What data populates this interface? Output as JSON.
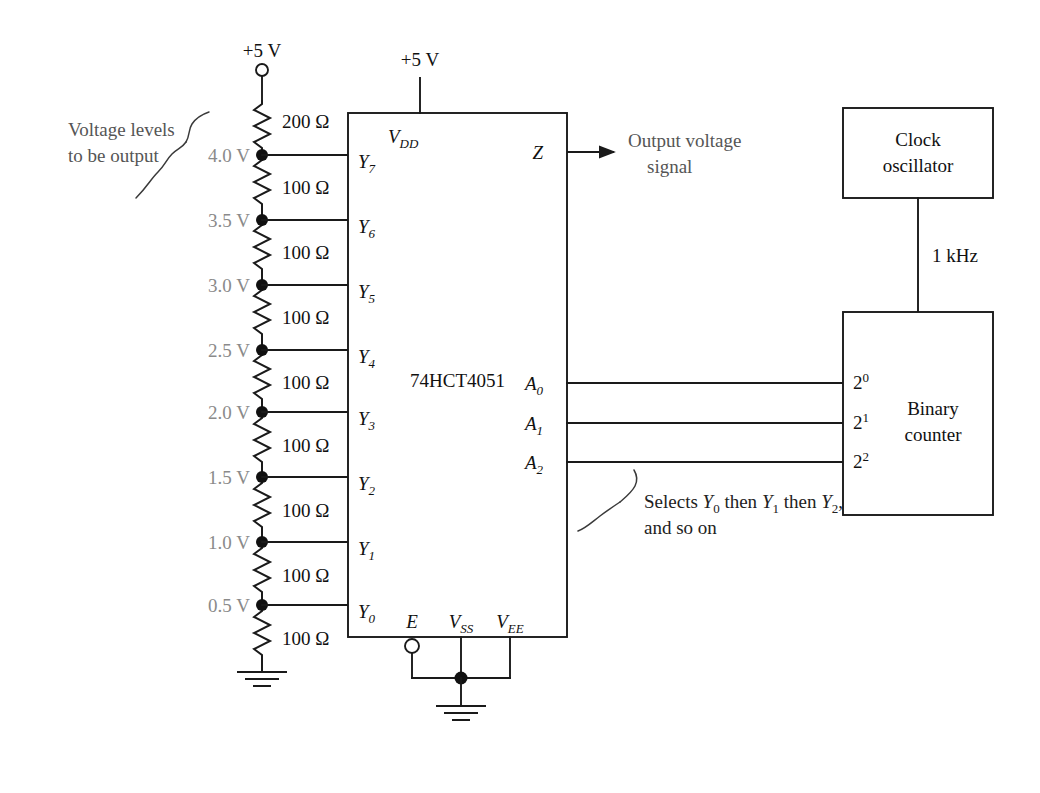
{
  "diagram": {
    "supply_top_left": "+5 V",
    "supply_chip": "+5 V",
    "chip_name": "74HCT4051",
    "colors": {
      "wire": "#1a1a1a",
      "voltage_label": "#8a8a8a",
      "annotation": "#555555",
      "background": "#ffffff"
    }
  },
  "annotations": {
    "voltage_levels": {
      "line1": "Voltage levels",
      "line2": "to be output"
    },
    "output_signal": {
      "line1": "Output voltage",
      "line2": "signal"
    },
    "selects": {
      "line1_a": "Selects ",
      "line1_y0": "Y",
      "line1_y0_sub": "0",
      "line1_b": " then ",
      "line1_y1": "Y",
      "line1_y1_sub": "1",
      "line1_c": " then ",
      "line1_y2": "Y",
      "line1_y2_sub": "2",
      "line1_d": ",",
      "line2": "and so on"
    }
  },
  "divider": {
    "top_resistor": "200 Ω",
    "resistors": [
      "100 Ω",
      "100 Ω",
      "100 Ω",
      "100 Ω",
      "100 Ω",
      "100 Ω",
      "100 Ω",
      "100 Ω"
    ],
    "taps": [
      {
        "voltage": "4.0 V",
        "pin": "Y",
        "pin_sub": "7"
      },
      {
        "voltage": "3.5 V",
        "pin": "Y",
        "pin_sub": "6"
      },
      {
        "voltage": "3.0 V",
        "pin": "Y",
        "pin_sub": "5"
      },
      {
        "voltage": "2.5 V",
        "pin": "Y",
        "pin_sub": "4"
      },
      {
        "voltage": "2.0 V",
        "pin": "Y",
        "pin_sub": "3"
      },
      {
        "voltage": "1.5 V",
        "pin": "Y",
        "pin_sub": "2"
      },
      {
        "voltage": "1.0 V",
        "pin": "Y",
        "pin_sub": "1"
      },
      {
        "voltage": "0.5 V",
        "pin": "Y",
        "pin_sub": "0"
      }
    ]
  },
  "chip": {
    "label": "74HCT4051",
    "pin_vdd": "V",
    "pin_vdd_sub": "DD",
    "pin_z": "Z",
    "pin_e": "E",
    "pin_vss": "V",
    "pin_vss_sub": "SS",
    "pin_vee": "V",
    "pin_vee_sub": "EE",
    "address_pins": [
      {
        "label": "A",
        "sub": "0"
      },
      {
        "label": "A",
        "sub": "1"
      },
      {
        "label": "A",
        "sub": "2"
      }
    ]
  },
  "clock": {
    "line1": "Clock",
    "line2": "oscillator",
    "frequency": "1 kHz"
  },
  "counter": {
    "line1": "Binary",
    "line2": "counter",
    "bit_pins": [
      {
        "base": "2",
        "exp": "0"
      },
      {
        "base": "2",
        "exp": "1"
      },
      {
        "base": "2",
        "exp": "2"
      }
    ]
  }
}
